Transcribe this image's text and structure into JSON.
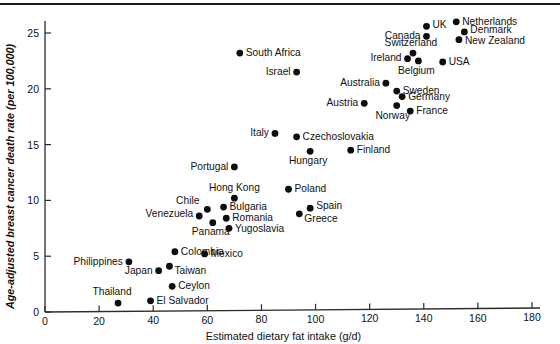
{
  "figure": {
    "name": "breast-cancer-fat-intake-scatter",
    "top_rule": true
  },
  "chart_data": {
    "type": "scatter",
    "title": "",
    "xlabel": "Estimated dietary fat intake (g/d)",
    "ylabel": "Age-adjusted breast cancer death rate (per 100,000)",
    "xlim": [
      0,
      185
    ],
    "ylim": [
      0,
      26.5
    ],
    "xticks": [
      0,
      20,
      40,
      60,
      80,
      100,
      120,
      140,
      160,
      180
    ],
    "yticks": [
      0,
      5,
      10,
      15,
      20,
      25
    ],
    "grid": false,
    "legend": false,
    "marker": "filled-circle",
    "marker_color": "#0d0d0d",
    "points": [
      {
        "label": "Thailand",
        "x": 27,
        "y": 0.8,
        "lx": -6,
        "ly": -8,
        "anchor": "middle"
      },
      {
        "label": "El Salvador",
        "x": 39,
        "y": 1.0,
        "lx": 6,
        "ly": 3,
        "anchor": "start"
      },
      {
        "label": "Ceylon",
        "x": 47,
        "y": 2.3,
        "lx": 6,
        "ly": 3,
        "anchor": "start"
      },
      {
        "label": "Japan",
        "x": 42,
        "y": 3.7,
        "lx": -6,
        "ly": 3,
        "anchor": "end"
      },
      {
        "label": "Taiwan",
        "x": 46,
        "y": 4.1,
        "lx": 5,
        "ly": 8,
        "anchor": "start"
      },
      {
        "label": "Philippines",
        "x": 31,
        "y": 4.5,
        "lx": -6,
        "ly": 3,
        "anchor": "end"
      },
      {
        "label": "Mexico",
        "x": 59,
        "y": 5.2,
        "lx": 6,
        "ly": 3,
        "anchor": "start"
      },
      {
        "label": "Colombia",
        "x": 48,
        "y": 5.4,
        "lx": 6,
        "ly": 3,
        "anchor": "start"
      },
      {
        "label": "Yugoslavia",
        "x": 68,
        "y": 7.5,
        "lx": 6,
        "ly": 4,
        "anchor": "start"
      },
      {
        "label": "Panama",
        "x": 62,
        "y": 8.0,
        "lx": -2,
        "ly": 12,
        "anchor": "middle"
      },
      {
        "label": "Romania",
        "x": 67,
        "y": 8.4,
        "lx": 6,
        "ly": 3,
        "anchor": "start"
      },
      {
        "label": "Greece",
        "x": 94,
        "y": 8.8,
        "lx": 5,
        "ly": 8,
        "anchor": "start"
      },
      {
        "label": "Venezuela",
        "x": 57,
        "y": 8.6,
        "lx": -6,
        "ly": 1,
        "anchor": "end"
      },
      {
        "label": "Chile",
        "x": 60,
        "y": 9.2,
        "lx": -8,
        "ly": -5,
        "anchor": "end"
      },
      {
        "label": "Spain",
        "x": 98,
        "y": 9.3,
        "lx": 6,
        "ly": 1,
        "anchor": "start"
      },
      {
        "label": "Bulgaria",
        "x": 66,
        "y": 9.4,
        "lx": 6,
        "ly": 3,
        "anchor": "start"
      },
      {
        "label": "Hong Kong",
        "x": 70,
        "y": 10.2,
        "lx": 0,
        "ly": -7,
        "anchor": "middle"
      },
      {
        "label": "Poland",
        "x": 90,
        "y": 11.0,
        "lx": 6,
        "ly": 3,
        "anchor": "start"
      },
      {
        "label": "Portugal",
        "x": 70,
        "y": 13.0,
        "lx": -6,
        "ly": 3,
        "anchor": "end"
      },
      {
        "label": "Hungary",
        "x": 98,
        "y": 14.4,
        "lx": -2,
        "ly": 13,
        "anchor": "middle"
      },
      {
        "label": "Finland",
        "x": 113,
        "y": 14.5,
        "lx": 6,
        "ly": 3,
        "anchor": "start"
      },
      {
        "label": "Czechoslovakia",
        "x": 93,
        "y": 15.7,
        "lx": 6,
        "ly": 3,
        "anchor": "start"
      },
      {
        "label": "Italy",
        "x": 85,
        "y": 16.0,
        "lx": -6,
        "ly": 3,
        "anchor": "end"
      },
      {
        "label": "France",
        "x": 135,
        "y": 18.0,
        "lx": 6,
        "ly": 3,
        "anchor": "start"
      },
      {
        "label": "Norway",
        "x": 130,
        "y": 18.5,
        "lx": -4,
        "ly": 13,
        "anchor": "middle"
      },
      {
        "label": "Austria",
        "x": 118,
        "y": 18.7,
        "lx": -6,
        "ly": 3,
        "anchor": "end"
      },
      {
        "label": "Germany",
        "x": 132,
        "y": 19.3,
        "lx": 6,
        "ly": 3,
        "anchor": "start"
      },
      {
        "label": "Sweden",
        "x": 130,
        "y": 19.8,
        "lx": 6,
        "ly": 3,
        "anchor": "start"
      },
      {
        "label": "Australia",
        "x": 126,
        "y": 20.5,
        "lx": -6,
        "ly": 3,
        "anchor": "end"
      },
      {
        "label": "USA",
        "x": 147,
        "y": 22.4,
        "lx": 6,
        "ly": 3,
        "anchor": "start"
      },
      {
        "label": "Belgium",
        "x": 138,
        "y": 22.5,
        "lx": -2,
        "ly": 13,
        "anchor": "middle"
      },
      {
        "label": "Ireland",
        "x": 134,
        "y": 22.7,
        "lx": -6,
        "ly": 2,
        "anchor": "end"
      },
      {
        "label": "Switzerland",
        "x": 136,
        "y": 23.2,
        "lx": -2,
        "ly": -7,
        "anchor": "middle"
      },
      {
        "label": "New Zealand",
        "x": 153,
        "y": 24.4,
        "lx": 6,
        "ly": 4,
        "anchor": "start"
      },
      {
        "label": "Canada",
        "x": 141,
        "y": 24.7,
        "lx": -6,
        "ly": 3,
        "anchor": "end"
      },
      {
        "label": "Denmark",
        "x": 155,
        "y": 25.1,
        "lx": 6,
        "ly": 1,
        "anchor": "start"
      },
      {
        "label": "UK",
        "x": 141,
        "y": 25.6,
        "lx": 6,
        "ly": 2,
        "anchor": "start"
      },
      {
        "label": "Netherlands",
        "x": 152,
        "y": 26.0,
        "lx": 6,
        "ly": 3,
        "anchor": "start"
      },
      {
        "label": "South Africa",
        "x": 72,
        "y": 23.2,
        "lx": 6,
        "ly": 3,
        "anchor": "start"
      },
      {
        "label": "Israel",
        "x": 93,
        "y": 21.5,
        "lx": -6,
        "ly": 3,
        "anchor": "end"
      }
    ]
  }
}
